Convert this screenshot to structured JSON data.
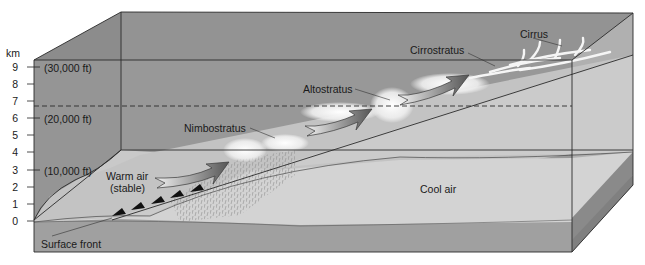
{
  "diagram": {
    "axis": {
      "unit": "km",
      "ticks": [
        "9",
        "8",
        "7",
        "6",
        "5",
        "4",
        "3",
        "2",
        "1",
        "0"
      ],
      "feet_labels": [
        {
          "km": "9",
          "label": "(30,000 ft)"
        },
        {
          "km": "6",
          "label": "(20,000 ft)"
        },
        {
          "km": "3",
          "label": "(10,000 ft)"
        }
      ]
    },
    "labels": {
      "cirrus": "Cirrus",
      "cirrostratus": "Cirrostratus",
      "altostratus": "Altostratus",
      "nimbostratus": "Nimbostratus",
      "warm_air_line1": "Warm air",
      "warm_air_line2": "(stable)",
      "cool_air": "Cool air",
      "surface_front": "Surface front"
    },
    "colors": {
      "box_dark": "#8f8f8f",
      "box_mid": "#a3a3a3",
      "warm_air_surface": "#c4c4c4",
      "cool_air": "#d3d3d3",
      "ground_front": "#9e9e9e",
      "ground_side": "#838383",
      "arrow": "#6b6b6b",
      "cloud": "#f4f4f4",
      "line": "#2a2a2a"
    }
  }
}
